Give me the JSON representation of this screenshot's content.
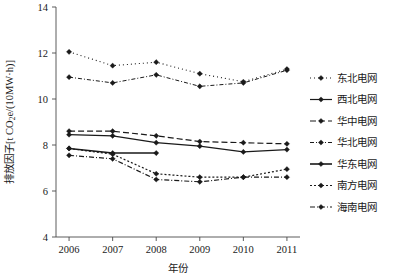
{
  "chart_data": {
    "type": "line",
    "title": "",
    "xlabel": "年份",
    "ylabel": "排放因子[t CO2e/(10MW·h)]",
    "ylabel_parts": {
      "pre": "排放因子[t CO",
      "sub": "2",
      "post": "e/(10MW·h)]"
    },
    "categories": [
      "2006",
      "2007",
      "2008",
      "2009",
      "2010",
      "2011"
    ],
    "x": [
      2006,
      2007,
      2008,
      2009,
      2010,
      2011
    ],
    "xlim": [
      2005.7,
      2011.3
    ],
    "ylim": [
      4,
      14
    ],
    "yticks": [
      4,
      6,
      8,
      10,
      12,
      14
    ],
    "xticks": [
      "2006",
      "2007",
      "2008",
      "2009",
      "2010",
      "2011"
    ],
    "grid": false,
    "legend_position": "right",
    "marker": "diamond",
    "color": "#1a1a1a",
    "series": [
      {
        "name": "东北电网",
        "style": "dotted",
        "dash": "1,3",
        "width": 1.1,
        "values": [
          12.05,
          11.45,
          11.6,
          11.1,
          10.75,
          11.3
        ]
      },
      {
        "name": "西北电网",
        "style": "solid",
        "dash": "none",
        "width": 1.2,
        "values": [
          8.45,
          8.4,
          8.1,
          7.95,
          7.7,
          7.8
        ]
      },
      {
        "name": "华中电网",
        "style": "dashed",
        "dash": "6,3",
        "width": 1.2,
        "values": [
          8.6,
          8.6,
          8.4,
          8.15,
          8.1,
          8.05
        ]
      },
      {
        "name": "华北电网",
        "style": "dash-dot-fine",
        "dash": "4,2,1,2",
        "width": 1.0,
        "values": [
          10.95,
          10.7,
          11.05,
          10.55,
          10.7,
          11.25
        ]
      },
      {
        "name": "华东电网",
        "style": "solid-bold",
        "dash": "none",
        "width": 1.6,
        "values": [
          7.85,
          7.65,
          7.65,
          null,
          null,
          null
        ]
      },
      {
        "name": "南方电网",
        "style": "dotted-dense",
        "dash": "2,2",
        "width": 1.2,
        "values": [
          7.85,
          7.6,
          6.75,
          6.6,
          6.6,
          6.95
        ]
      },
      {
        "name": "海南电网",
        "style": "dash-dot",
        "dash": "5,2,1,2",
        "width": 1.2,
        "values": [
          7.55,
          7.4,
          6.5,
          6.4,
          6.6,
          6.6
        ]
      }
    ]
  },
  "legend": {
    "entries": [
      {
        "label": "东北电网"
      },
      {
        "label": "西北电网"
      },
      {
        "label": "华中电网"
      },
      {
        "label": "华北电网"
      },
      {
        "label": "华东电网"
      },
      {
        "label": "南方电网"
      },
      {
        "label": "海南电网"
      }
    ]
  }
}
